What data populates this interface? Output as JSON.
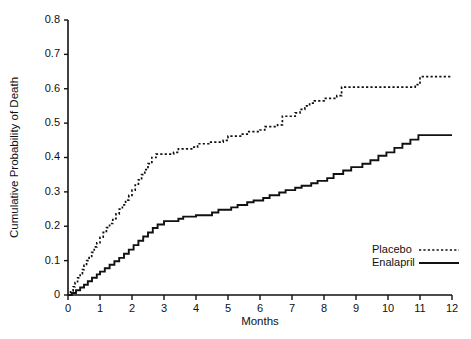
{
  "chart_data": {
    "type": "line",
    "title": "",
    "xlabel": "Months",
    "ylabel": "Cumulative Probability of Death",
    "xlim": [
      0,
      12
    ],
    "ylim": [
      0,
      0.8
    ],
    "grid": false,
    "legend_position": "bottom-right",
    "xticks": [
      "0",
      "1",
      "2",
      "3",
      "4",
      "5",
      "6",
      "7",
      "8",
      "9",
      "10",
      "11",
      "12"
    ],
    "xtick_values": [
      0,
      1,
      2,
      3,
      4,
      5,
      6,
      7,
      8,
      9,
      10,
      11,
      12
    ],
    "yticks": [
      "0",
      "0.1",
      "0.2",
      "0.3",
      "0.4",
      "0.5",
      "0.6",
      "0.7",
      "0.8"
    ],
    "ytick_values": [
      0,
      0.1,
      0.2,
      0.3,
      0.4,
      0.5,
      0.6,
      0.7,
      0.8
    ],
    "series": [
      {
        "name": "Placebo",
        "style": "dotted",
        "color": "#111111",
        "x": [
          0,
          0.08,
          0.16,
          0.22,
          0.3,
          0.38,
          0.45,
          0.5,
          0.58,
          0.66,
          0.74,
          0.82,
          0.9,
          1.0,
          1.1,
          1.2,
          1.3,
          1.4,
          1.5,
          1.6,
          1.7,
          1.8,
          1.9,
          2.0,
          2.1,
          2.2,
          2.3,
          2.4,
          2.5,
          2.62,
          2.75,
          3.3,
          3.45,
          3.9,
          4.05,
          4.4,
          4.85,
          5.0,
          5.45,
          5.6,
          6.0,
          6.15,
          6.55,
          6.7,
          7.1,
          7.25,
          7.4,
          7.55,
          7.7,
          8.0,
          8.4,
          8.55,
          10.85,
          11.0,
          12.0
        ],
        "y": [
          0,
          0.012,
          0.024,
          0.036,
          0.05,
          0.062,
          0.074,
          0.086,
          0.1,
          0.112,
          0.124,
          0.14,
          0.152,
          0.168,
          0.182,
          0.196,
          0.208,
          0.222,
          0.236,
          0.25,
          0.262,
          0.276,
          0.29,
          0.305,
          0.32,
          0.335,
          0.35,
          0.365,
          0.382,
          0.4,
          0.41,
          0.415,
          0.425,
          0.43,
          0.44,
          0.445,
          0.45,
          0.462,
          0.468,
          0.475,
          0.48,
          0.49,
          0.495,
          0.52,
          0.53,
          0.54,
          0.55,
          0.558,
          0.565,
          0.572,
          0.58,
          0.605,
          0.612,
          0.635,
          0.635
        ]
      },
      {
        "name": "Enalapril",
        "style": "solid",
        "color": "#111111",
        "x": [
          0,
          0.12,
          0.25,
          0.38,
          0.5,
          0.62,
          0.75,
          0.9,
          1.0,
          1.15,
          1.3,
          1.45,
          1.6,
          1.75,
          1.9,
          2.05,
          2.2,
          2.35,
          2.5,
          2.65,
          2.8,
          3.0,
          3.45,
          3.6,
          4.0,
          4.5,
          4.7,
          5.1,
          5.3,
          5.6,
          5.8,
          6.1,
          6.3,
          6.6,
          6.8,
          7.1,
          7.3,
          7.6,
          7.8,
          8.1,
          8.3,
          8.6,
          8.85,
          9.2,
          9.45,
          9.7,
          9.95,
          10.2,
          10.45,
          10.7,
          10.95,
          12.0
        ],
        "y": [
          0,
          0.006,
          0.014,
          0.022,
          0.03,
          0.04,
          0.05,
          0.06,
          0.068,
          0.078,
          0.088,
          0.098,
          0.108,
          0.12,
          0.132,
          0.145,
          0.158,
          0.17,
          0.182,
          0.195,
          0.205,
          0.215,
          0.222,
          0.228,
          0.232,
          0.24,
          0.248,
          0.255,
          0.262,
          0.27,
          0.275,
          0.282,
          0.29,
          0.298,
          0.305,
          0.312,
          0.318,
          0.325,
          0.332,
          0.34,
          0.352,
          0.362,
          0.372,
          0.382,
          0.392,
          0.405,
          0.415,
          0.428,
          0.44,
          0.452,
          0.465,
          0.465
        ]
      }
    ],
    "annotations": []
  },
  "legend": {
    "items": [
      {
        "label": "Placebo"
      },
      {
        "label": "Enalapril"
      }
    ]
  }
}
